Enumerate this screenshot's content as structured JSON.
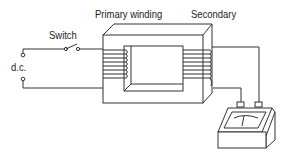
{
  "diagram": {
    "type": "transformer experiment",
    "labels": {
      "switch": "Switch",
      "primary": "Primary winding",
      "secondary": "Secondary",
      "supply": "d.c."
    },
    "components": [
      {
        "name": "dc-supply-terminals",
        "label": "d.c."
      },
      {
        "name": "switch",
        "label": "Switch",
        "state": "open"
      },
      {
        "name": "iron-core",
        "shape": "rectangular frame"
      },
      {
        "name": "primary-winding",
        "label": "Primary winding",
        "turns": 8
      },
      {
        "name": "secondary-winding",
        "label": "Secondary",
        "turns": 8
      },
      {
        "name": "galvanometer",
        "label": ""
      }
    ],
    "colors": {
      "line": "#333333",
      "background": "#ffffff"
    }
  }
}
